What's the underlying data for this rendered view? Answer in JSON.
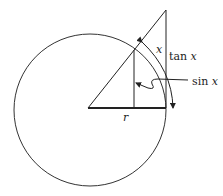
{
  "diagram": {
    "title": "",
    "labels": {
      "radius": "r",
      "arc": "x",
      "tangent_fn": "tan",
      "tangent_var": "x",
      "sine_fn": "sin",
      "sine_var": "x"
    },
    "geometry": {
      "center": [
        88,
        108
      ],
      "radius": 78,
      "tangent_point": [
        166,
        108
      ],
      "tangent_top": [
        166,
        10
      ],
      "sine_foot": [
        134,
        108
      ],
      "sine_top": [
        134,
        50
      ]
    },
    "colors": {
      "stroke": "#222222",
      "background": "#ffffff"
    }
  }
}
